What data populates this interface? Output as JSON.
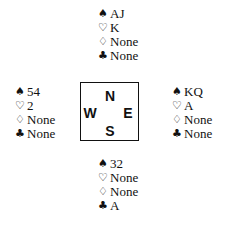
{
  "suits": {
    "spades": "♠",
    "hearts": "♡",
    "diamonds": "♢",
    "clubs": "♣"
  },
  "compass": {
    "north": "N",
    "south": "S",
    "east": "E",
    "west": "W"
  },
  "hands": {
    "north": {
      "spades": "AJ",
      "hearts": "K",
      "diamonds": "None",
      "clubs": "None"
    },
    "west": {
      "spades": "54",
      "hearts": "2",
      "diamonds": "None",
      "clubs": "None"
    },
    "east": {
      "spades": "KQ",
      "hearts": "A",
      "diamonds": "None",
      "clubs": "None"
    },
    "south": {
      "spades": "32",
      "hearts": "None",
      "diamonds": "None",
      "clubs": "A"
    }
  }
}
